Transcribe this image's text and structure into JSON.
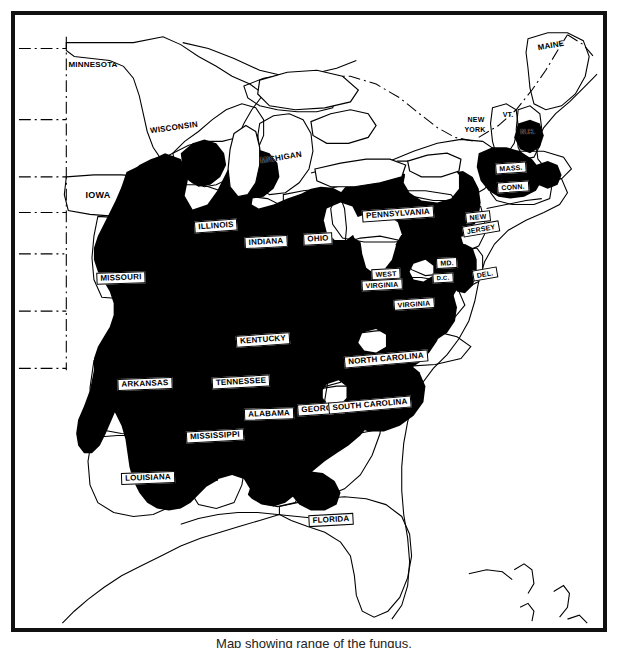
{
  "figure": {
    "kind": "distribution-range-map",
    "region": "Eastern United States",
    "style": "black-and-white line map with solid black shaded range",
    "frame_color": "#111111",
    "land_color": "#ffffff",
    "shaded_color": "#000000",
    "outline_color": "#000000",
    "caption": "Map showing range of the fungus."
  },
  "legend": {
    "shaded_meaning": "shaded (black) area = range",
    "unshaded_meaning": "unshaded (white) area = outside range"
  },
  "map": {
    "labels": [
      {
        "name": "MINNESOTA",
        "x": 78,
        "y": 50,
        "style": "on-white",
        "size": "sz-8",
        "rotate": 0,
        "shaded": false
      },
      {
        "name": "WISCONSIN",
        "x": 159,
        "y": 113,
        "style": "on-white",
        "size": "sz-8",
        "rotate": -8,
        "shaded": false
      },
      {
        "name": "MICHIGAN",
        "x": 266,
        "y": 143,
        "style": "on-white",
        "size": "sz-8",
        "rotate": -9,
        "shaded": false
      },
      {
        "name": "IOWA",
        "x": 83,
        "y": 180,
        "style": "on-white",
        "size": "sz-9",
        "rotate": 0,
        "shaded": false
      },
      {
        "name": "ILLINOIS",
        "x": 201,
        "y": 211,
        "style": "plate",
        "size": "sz-8",
        "rotate": -4,
        "shaded": true
      },
      {
        "name": "INDIANA",
        "x": 251,
        "y": 227,
        "style": "plate",
        "size": "sz-8",
        "rotate": -3,
        "shaded": true
      },
      {
        "name": "OHIO",
        "x": 303,
        "y": 224,
        "style": "plate",
        "size": "sz-8",
        "rotate": -3,
        "shaded": true
      },
      {
        "name": "MISSOURI",
        "x": 106,
        "y": 263,
        "style": "plate",
        "size": "sz-8",
        "rotate": -2,
        "shaded": true
      },
      {
        "name": "KENTUCKY",
        "x": 248,
        "y": 325,
        "style": "plate",
        "size": "sz-8",
        "rotate": -4,
        "shaded": true
      },
      {
        "name": "ARKANSAS",
        "x": 130,
        "y": 369,
        "style": "plate",
        "size": "sz-8",
        "rotate": -2,
        "shaded": true
      },
      {
        "name": "TENNESSEE",
        "x": 226,
        "y": 367,
        "style": "plate",
        "size": "sz-8",
        "rotate": -3,
        "shaded": true
      },
      {
        "name": "MISSISSIPPI",
        "x": 200,
        "y": 421,
        "style": "plate",
        "size": "sz-8",
        "rotate": -3,
        "shaded": true
      },
      {
        "name": "ALABAMA",
        "x": 254,
        "y": 399,
        "style": "plate",
        "size": "sz-8",
        "rotate": -2,
        "shaded": true
      },
      {
        "name": "GEORGIA",
        "x": 306,
        "y": 394,
        "style": "plate",
        "size": "sz-8",
        "rotate": -4,
        "shaded": true
      },
      {
        "name": "LOUISIANA",
        "x": 133,
        "y": 463,
        "style": "plate",
        "size": "sz-8",
        "rotate": -2,
        "shaded": true
      },
      {
        "name": "FLORIDA",
        "x": 316,
        "y": 505,
        "style": "plate",
        "size": "sz-8",
        "rotate": -3,
        "shaded": false
      },
      {
        "name": "SOUTH CAROLINA",
        "x": 355,
        "y": 390,
        "style": "plate",
        "size": "sz-8",
        "rotate": -5,
        "shaded": true
      },
      {
        "name": "NORTH CAROLINA",
        "x": 371,
        "y": 344,
        "style": "plate",
        "size": "sz-8",
        "rotate": -5,
        "shaded": true
      },
      {
        "name": "VIRGINIA",
        "x": 399,
        "y": 289,
        "style": "plate",
        "size": "sz-7",
        "rotate": -4,
        "shaded": true
      },
      {
        "name": "WEST",
        "x": 371,
        "y": 259,
        "style": "plate",
        "size": "sz-7",
        "rotate": -3,
        "shaded": true
      },
      {
        "name": "VIRGINIA",
        "x": 367,
        "y": 270,
        "style": "plate",
        "size": "sz-7",
        "rotate": -3,
        "shaded": true
      },
      {
        "name": "MD.",
        "x": 432,
        "y": 248,
        "style": "plate",
        "size": "sz-7",
        "rotate": -3,
        "shaded": true
      },
      {
        "name": "D.C.",
        "x": 428,
        "y": 263,
        "style": "plate",
        "size": "sz-6",
        "rotate": -3,
        "shaded": true
      },
      {
        "name": "DEL.",
        "x": 470,
        "y": 259,
        "style": "plate",
        "size": "sz-7",
        "rotate": -10,
        "shaded": true
      },
      {
        "name": "PENNSYLVANIA",
        "x": 383,
        "y": 199,
        "style": "plate",
        "size": "sz-8",
        "rotate": -4,
        "shaded": false
      },
      {
        "name": "NEW",
        "x": 463,
        "y": 202,
        "style": "plate",
        "size": "sz-7",
        "rotate": -6,
        "shaded": true
      },
      {
        "name": "JERSEY",
        "x": 466,
        "y": 214,
        "style": "plate",
        "size": "sz-7",
        "rotate": -10,
        "shaded": true
      },
      {
        "name": "NEW",
        "x": 461,
        "y": 104,
        "style": "on-white",
        "size": "sz-7",
        "rotate": 0,
        "shaded": false
      },
      {
        "name": "YORK",
        "x": 460,
        "y": 114,
        "style": "on-white",
        "size": "sz-7",
        "rotate": 0,
        "shaded": false
      },
      {
        "name": "VT.",
        "x": 493,
        "y": 99,
        "style": "on-white",
        "size": "sz-7",
        "rotate": 0,
        "shaded": false
      },
      {
        "name": "N.H.",
        "x": 513,
        "y": 116,
        "style": "on-white",
        "size": "sz-7",
        "rotate": 0,
        "shaded": false
      },
      {
        "name": "MASS.",
        "x": 496,
        "y": 153,
        "style": "plate",
        "size": "sz-7",
        "rotate": -4,
        "shaded": true
      },
      {
        "name": "CONN.",
        "x": 498,
        "y": 172,
        "style": "plate",
        "size": "sz-7",
        "rotate": -4,
        "shaded": true
      },
      {
        "name": "MAINE",
        "x": 536,
        "y": 31,
        "style": "on-white",
        "size": "sz-8",
        "rotate": -10,
        "shaded": false
      }
    ],
    "states_shaded": [
      "Missouri",
      "Arkansas",
      "Louisiana",
      "Mississippi",
      "Alabama",
      "Georgia",
      "Tennessee",
      "Kentucky",
      "Illinois",
      "Indiana",
      "Ohio",
      "South Carolina",
      "North Carolina",
      "Virginia",
      "West Virginia",
      "Maryland",
      "Delaware",
      "New Jersey",
      "Massachusetts",
      "Connecticut"
    ],
    "states_unshaded": [
      "Minnesota",
      "Wisconsin",
      "Michigan",
      "Iowa",
      "Maine",
      "Vermont",
      "New Hampshire",
      "Florida"
    ],
    "states_partial": [
      "Pennsylvania",
      "New York",
      "Michigan",
      "Iowa",
      "Wisconsin",
      "Florida",
      "Texas"
    ]
  }
}
